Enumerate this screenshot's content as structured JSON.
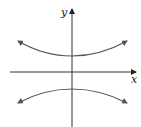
{
  "figure": {
    "type": "hyperbola",
    "orientation": "vertical",
    "axes": {
      "x_label": "x",
      "y_label": "y"
    },
    "branches": [
      {
        "name": "upper",
        "vertex": [
          0,
          1
        ],
        "opens": "up"
      },
      {
        "name": "lower",
        "vertex": [
          0,
          -1
        ],
        "opens": "down"
      }
    ],
    "colors": {
      "curve": "#555555",
      "axis": "#222222",
      "background": "#ffffff"
    }
  }
}
